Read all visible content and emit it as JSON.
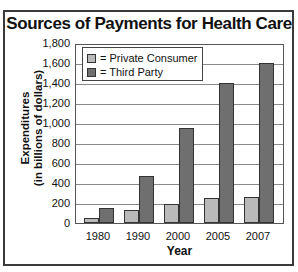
{
  "chart_data": {
    "type": "bar",
    "title": "Sources of Payments for Health Care",
    "xlabel": "Year",
    "ylabel": "Expenditures (in billions of dollars)",
    "ylabel_lines": [
      "Expenditures",
      "(in billions of dollars)"
    ],
    "categories": [
      "1980",
      "1990",
      "2000",
      "2005",
      "2007"
    ],
    "series": [
      {
        "name": "Private Consumer",
        "color": "#b9b9b9",
        "values": [
          50,
          130,
          190,
          250,
          260
        ]
      },
      {
        "name": "Third Party",
        "color": "#6f6f6f",
        "values": [
          150,
          470,
          950,
          1400,
          1600
        ]
      }
    ],
    "ylim": [
      0,
      1800
    ],
    "yticks": [
      "0",
      "200",
      "400",
      "600",
      "800",
      "1,000",
      "1,200",
      "1,400",
      "1,600",
      "1,800"
    ],
    "grid": true,
    "legend_position": "top-left inside",
    "legend_entries": [
      "= Private Consumer",
      "= Third Party"
    ]
  }
}
